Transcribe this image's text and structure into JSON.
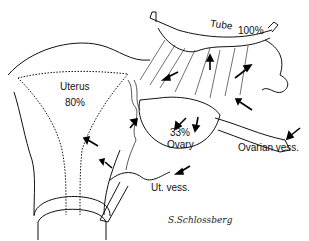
{
  "figure": {
    "labels": {
      "tube": "Tube",
      "tube_pct": "100%",
      "uterus": "Uterus",
      "uterus_pct": "80%",
      "ovary_pct": "33%",
      "ovary": "Ovary",
      "ovarian_vessels": "Ovarian vess.",
      "uterine_vessels": "Ut. vess."
    },
    "signature": "S.Schlossberg"
  }
}
